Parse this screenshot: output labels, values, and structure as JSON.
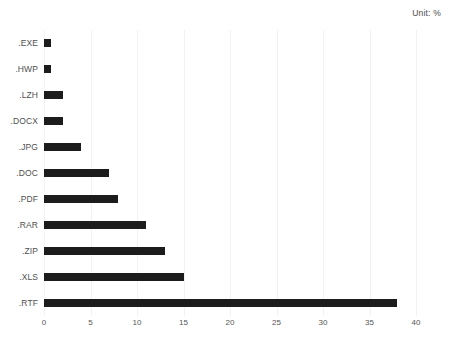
{
  "annotation": {
    "unit_label": "Unit: %"
  },
  "chart_data": {
    "type": "bar",
    "orientation": "horizontal",
    "title": "",
    "subtitle": "",
    "xlabel": "",
    "ylabel": "",
    "xlim": [
      0,
      40
    ],
    "xticks": [
      0,
      5,
      10,
      15,
      20,
      25,
      30,
      35,
      40
    ],
    "xtick_labels": [
      "0",
      "5",
      "10",
      "15",
      "20",
      "25",
      "30",
      "35",
      "40"
    ],
    "grid": "vertical",
    "legend": "none",
    "annotations": [
      "Unit: %"
    ],
    "bar_color": "#1c1c1c",
    "background_color": "#ffffff",
    "label_color": "#4f4f4f",
    "gridline_color": "#f2f2f2",
    "categories": [
      ".EXE",
      ".HWP",
      ".LZH",
      ".DOCX",
      ".JPG",
      ".DOC",
      ".PDF",
      ".RAR",
      ".ZIP",
      ".XLS",
      ".RTF"
    ],
    "values": [
      0.8,
      0.8,
      2,
      2,
      4,
      7,
      8,
      11,
      13,
      15,
      38
    ]
  }
}
